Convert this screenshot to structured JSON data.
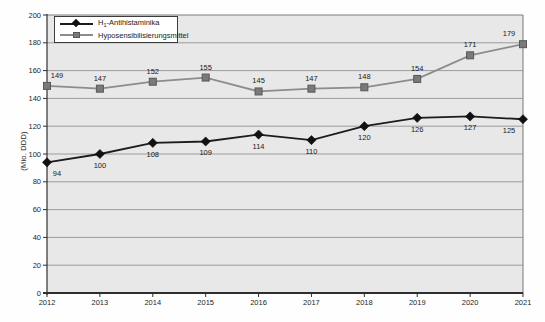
{
  "chart_data": {
    "type": "line",
    "title": "",
    "xlabel": "",
    "ylabel": "(Mio. DDD)",
    "categories": [
      "2012",
      "2013",
      "2014",
      "2015",
      "2016",
      "2017",
      "2018",
      "2019",
      "2020",
      "2021"
    ],
    "yticks": [
      0,
      20,
      40,
      60,
      80,
      100,
      120,
      140,
      160,
      180,
      200
    ],
    "ylim": [
      0,
      200
    ],
    "grid": "horizontal",
    "legend_position": "top-left-inside",
    "series": [
      {
        "name_prefix": "H",
        "name_sub": "1",
        "name_rest": "-Antihistaminika",
        "marker": "diamond",
        "color": "#1c1c1c",
        "marker_fill": "#111111",
        "marker_stroke": "#000000",
        "label_position": "below",
        "values": [
          94,
          100,
          108,
          109,
          114,
          110,
          120,
          126,
          127,
          125
        ]
      },
      {
        "name_prefix": "",
        "name_sub": "",
        "name_rest": "Hyposensibilisierungsmittel",
        "marker": "square",
        "color": "#8c8c8c",
        "marker_fill": "#7a7a7a",
        "marker_stroke": "#585858",
        "label_position": "above",
        "values": [
          149,
          147,
          152,
          155,
          145,
          147,
          148,
          154,
          171,
          179
        ]
      }
    ]
  },
  "colors": {
    "plot_background": "#e8e8e8",
    "gridline": "#9c9c9c",
    "axis": "#2f2f2f",
    "right_border": "#8a8a8a",
    "top_border": "#7d7d7d",
    "label_text": "#1a1a1a",
    "tick_text": "#262626"
  }
}
